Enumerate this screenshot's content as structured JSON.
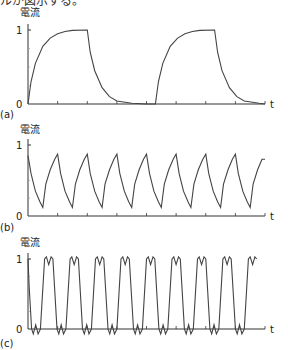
{
  "header": {
    "partial_caption": "ルが図示する。"
  },
  "chart_data": [
    {
      "type": "line",
      "panel_label": "(a)",
      "ylabel": "電流",
      "xlabel": "t",
      "yticks": [
        "0",
        "1"
      ],
      "ylim": [
        0,
        1
      ],
      "x_ticks_count": 8,
      "description": "Slow square-wave switching; current rises exponentially to 1 and decays to 0 (period = 4 tick units).",
      "points": [
        [
          0,
          0
        ],
        [
          0.1,
          0.3
        ],
        [
          0.25,
          0.55
        ],
        [
          0.5,
          0.78
        ],
        [
          0.75,
          0.89
        ],
        [
          1,
          0.95
        ],
        [
          1.25,
          0.98
        ],
        [
          1.5,
          0.995
        ],
        [
          2,
          1
        ],
        [
          2,
          1
        ],
        [
          2.1,
          0.7
        ],
        [
          2.25,
          0.45
        ],
        [
          2.5,
          0.22
        ],
        [
          2.75,
          0.1
        ],
        [
          3,
          0.04
        ],
        [
          3.5,
          0.01
        ],
        [
          4,
          0
        ],
        [
          4.3,
          0
        ],
        [
          4.3,
          0
        ],
        [
          4.4,
          0.3
        ],
        [
          4.55,
          0.55
        ],
        [
          4.8,
          0.78
        ],
        [
          5.05,
          0.89
        ],
        [
          5.3,
          0.95
        ],
        [
          5.55,
          0.98
        ],
        [
          5.8,
          0.995
        ],
        [
          6.3,
          1
        ],
        [
          6.3,
          1
        ],
        [
          6.4,
          0.7
        ],
        [
          6.55,
          0.45
        ],
        [
          6.8,
          0.22
        ],
        [
          7.05,
          0.1
        ],
        [
          7.3,
          0.04
        ],
        [
          7.8,
          0.01
        ],
        [
          8,
          0
        ]
      ]
    },
    {
      "type": "line",
      "panel_label": "(b)",
      "ylabel": "電流",
      "xlabel": "t",
      "yticks": [
        "0",
        "1"
      ],
      "ylim": [
        0,
        1
      ],
      "x_ticks_count": 8,
      "description": "Faster switching (period = 1 tick unit); current oscillates between ~0.12 and ~0.87.",
      "points": [
        [
          0,
          0.85
        ],
        [
          0.1,
          0.6
        ],
        [
          0.25,
          0.35
        ],
        [
          0.4,
          0.2
        ],
        [
          0.5,
          0.12
        ],
        [
          0.6,
          0.45
        ],
        [
          0.75,
          0.65
        ],
        [
          0.9,
          0.8
        ],
        [
          1,
          0.87
        ],
        [
          1.1,
          0.6
        ],
        [
          1.25,
          0.35
        ],
        [
          1.4,
          0.2
        ],
        [
          1.5,
          0.12
        ],
        [
          1.6,
          0.45
        ],
        [
          1.75,
          0.65
        ],
        [
          1.9,
          0.8
        ],
        [
          2,
          0.87
        ],
        [
          2.1,
          0.6
        ],
        [
          2.25,
          0.35
        ],
        [
          2.4,
          0.2
        ],
        [
          2.5,
          0.12
        ],
        [
          2.6,
          0.45
        ],
        [
          2.75,
          0.65
        ],
        [
          2.9,
          0.8
        ],
        [
          3,
          0.87
        ],
        [
          3.1,
          0.6
        ],
        [
          3.25,
          0.35
        ],
        [
          3.4,
          0.2
        ],
        [
          3.5,
          0.12
        ],
        [
          3.6,
          0.45
        ],
        [
          3.75,
          0.65
        ],
        [
          3.9,
          0.8
        ],
        [
          4,
          0.87
        ],
        [
          4.1,
          0.6
        ],
        [
          4.25,
          0.35
        ],
        [
          4.4,
          0.2
        ],
        [
          4.5,
          0.12
        ],
        [
          4.6,
          0.45
        ],
        [
          4.75,
          0.65
        ],
        [
          4.9,
          0.8
        ],
        [
          5,
          0.87
        ],
        [
          5.1,
          0.6
        ],
        [
          5.25,
          0.35
        ],
        [
          5.4,
          0.2
        ],
        [
          5.5,
          0.12
        ],
        [
          5.6,
          0.45
        ],
        [
          5.75,
          0.65
        ],
        [
          5.9,
          0.8
        ],
        [
          6,
          0.87
        ],
        [
          6.1,
          0.6
        ],
        [
          6.25,
          0.35
        ],
        [
          6.4,
          0.2
        ],
        [
          6.5,
          0.12
        ],
        [
          6.6,
          0.45
        ],
        [
          6.75,
          0.65
        ],
        [
          6.9,
          0.8
        ],
        [
          7,
          0.87
        ],
        [
          7.1,
          0.6
        ],
        [
          7.25,
          0.35
        ],
        [
          7.4,
          0.2
        ],
        [
          7.5,
          0.12
        ],
        [
          7.6,
          0.45
        ],
        [
          7.75,
          0.65
        ],
        [
          7.9,
          0.8
        ],
        [
          8,
          0.8
        ]
      ]
    },
    {
      "type": "line",
      "panel_label": "(c)",
      "ylabel": "電流",
      "xlabel": "t",
      "yticks": [
        "0",
        "1"
      ],
      "ylim": [
        0,
        1
      ],
      "x_ticks_count": 8,
      "description": "Nearly square-wave current (period = 1 tick unit) with small ripple at top (~1.0/0.9) and bottom (~0/-0.07).",
      "points": [
        [
          0,
          1
        ],
        [
          0.04,
          0.6
        ],
        [
          0.12,
          0
        ],
        [
          0.18,
          -0.07
        ],
        [
          0.26,
          0.06
        ],
        [
          0.34,
          -0.07
        ],
        [
          0.42,
          0
        ],
        [
          0.56,
          1
        ],
        [
          0.62,
          1.03
        ],
        [
          0.7,
          0.92
        ],
        [
          0.78,
          1.03
        ],
        [
          0.84,
          1
        ],
        [
          0.98,
          0
        ],
        [
          1.04,
          -0.07
        ],
        [
          1.12,
          0.06
        ],
        [
          1.2,
          -0.07
        ],
        [
          1.28,
          0
        ],
        [
          1.42,
          1
        ],
        [
          1.48,
          1.03
        ],
        [
          1.56,
          0.92
        ],
        [
          1.64,
          1.03
        ],
        [
          1.7,
          1
        ],
        [
          1.84,
          0
        ],
        [
          1.9,
          -0.07
        ],
        [
          1.98,
          0.06
        ],
        [
          2.06,
          -0.07
        ],
        [
          2.14,
          0
        ],
        [
          2.28,
          1
        ],
        [
          2.34,
          1.03
        ],
        [
          2.42,
          0.92
        ],
        [
          2.5,
          1.03
        ],
        [
          2.56,
          1
        ],
        [
          2.7,
          0
        ],
        [
          2.76,
          -0.07
        ],
        [
          2.84,
          0.06
        ],
        [
          2.92,
          -0.07
        ],
        [
          3,
          0
        ],
        [
          3.14,
          1
        ],
        [
          3.2,
          1.03
        ],
        [
          3.28,
          0.92
        ],
        [
          3.36,
          1.03
        ],
        [
          3.42,
          1
        ],
        [
          3.56,
          0
        ],
        [
          3.62,
          -0.07
        ],
        [
          3.7,
          0.06
        ],
        [
          3.78,
          -0.07
        ],
        [
          3.86,
          0
        ],
        [
          4,
          1
        ],
        [
          4.06,
          1.03
        ],
        [
          4.14,
          0.92
        ],
        [
          4.22,
          1.03
        ],
        [
          4.28,
          1
        ],
        [
          4.42,
          0
        ],
        [
          4.48,
          -0.07
        ],
        [
          4.56,
          0.06
        ],
        [
          4.64,
          -0.07
        ],
        [
          4.72,
          0
        ],
        [
          4.86,
          1
        ],
        [
          4.92,
          1.03
        ],
        [
          5,
          0.92
        ],
        [
          5.08,
          1.03
        ],
        [
          5.14,
          1
        ],
        [
          5.28,
          0
        ],
        [
          5.34,
          -0.07
        ],
        [
          5.42,
          0.06
        ],
        [
          5.5,
          -0.07
        ],
        [
          5.58,
          0
        ],
        [
          5.72,
          1
        ],
        [
          5.78,
          1.03
        ],
        [
          5.86,
          0.92
        ],
        [
          5.94,
          1.03
        ],
        [
          6,
          1
        ],
        [
          6.14,
          0
        ],
        [
          6.2,
          -0.07
        ],
        [
          6.28,
          0.06
        ],
        [
          6.36,
          -0.07
        ],
        [
          6.44,
          0
        ],
        [
          6.58,
          1
        ],
        [
          6.64,
          1.03
        ],
        [
          6.72,
          0.92
        ],
        [
          6.8,
          1.03
        ],
        [
          6.86,
          1
        ],
        [
          7,
          0
        ],
        [
          7.06,
          -0.07
        ],
        [
          7.14,
          0.06
        ],
        [
          7.22,
          -0.07
        ],
        [
          7.3,
          0
        ],
        [
          7.44,
          1
        ],
        [
          7.5,
          1.03
        ],
        [
          7.58,
          0.92
        ],
        [
          7.66,
          1.03
        ],
        [
          7.72,
          1
        ]
      ]
    }
  ],
  "layout": {
    "panels": [
      {
        "x0": 28,
        "x1": 265,
        "y0": 104,
        "y1": 30,
        "ylabel_y": 16,
        "label_y": 118
      },
      {
        "x0": 28,
        "x1": 265,
        "y0": 216,
        "y1": 145,
        "ylabel_y": 133,
        "label_y": 231
      },
      {
        "x0": 28,
        "x1": 265,
        "y0": 329,
        "y1": 259,
        "ylabel_y": 246,
        "label_y": 347
      }
    ],
    "line_color": "#444444",
    "axis_color": "#333333"
  }
}
